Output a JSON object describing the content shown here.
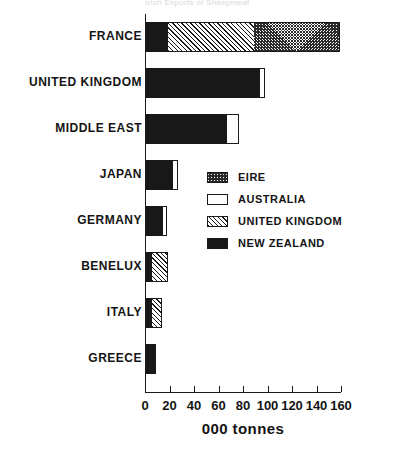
{
  "chart_data": {
    "type": "bar",
    "orientation": "horizontal",
    "stacked": true,
    "title": "Irish Exports of Sheepmeat",
    "xlabel": "000 tonnes",
    "ylabel": "",
    "xlim": [
      0,
      160
    ],
    "xticks": [
      0,
      20,
      40,
      60,
      80,
      100,
      120,
      140,
      160
    ],
    "xtick_labels": [
      "0",
      "20",
      "40",
      "60",
      "80",
      "100",
      "120",
      "140",
      "160"
    ],
    "grid": false,
    "legend_position": "center-right",
    "categories": [
      "FRANCE",
      "UNITED KINGDOM",
      "MIDDLE EAST",
      "JAPAN",
      "GERMANY",
      "BENELUX",
      "ITALY",
      "GREECE"
    ],
    "series": [
      {
        "name": "NEW ZEALAND",
        "pattern": "solid-black",
        "values": [
          19,
          94,
          67,
          23,
          15,
          6,
          6,
          9
        ]
      },
      {
        "name": "UNITED KINGDOM",
        "pattern": "diagonal-hatch",
        "values": [
          70,
          0,
          0,
          0,
          0,
          13,
          8,
          0
        ]
      },
      {
        "name": "AUSTRALIA",
        "pattern": "white",
        "values": [
          0,
          4,
          10,
          4,
          3,
          0,
          0,
          0
        ]
      },
      {
        "name": "EIRE",
        "pattern": "dense-crosshatch",
        "values": [
          70,
          0,
          0,
          0,
          0,
          0,
          0,
          0
        ]
      }
    ],
    "stack_order": [
      "NEW ZEALAND",
      "UNITED KINGDOM",
      "AUSTRALIA",
      "EIRE"
    ],
    "totals": [
      159,
      98,
      77,
      27,
      18,
      19,
      14,
      9
    ]
  },
  "legend": {
    "items": [
      {
        "label": "EIRE",
        "pattern": "dense-crosshatch"
      },
      {
        "label": "AUSTRALIA",
        "pattern": "white"
      },
      {
        "label": "UNITED KINGDOM",
        "pattern": "diagonal-hatch"
      },
      {
        "label": "NEW ZEALAND",
        "pattern": "solid-black"
      }
    ]
  },
  "colors": {
    "ink": "#1a1a1a",
    "background": "#ffffff",
    "new_zealand": "#181818",
    "australia": "#fdfdfd",
    "united_kingdom": "#ffffff",
    "eire": "#ffffff"
  }
}
